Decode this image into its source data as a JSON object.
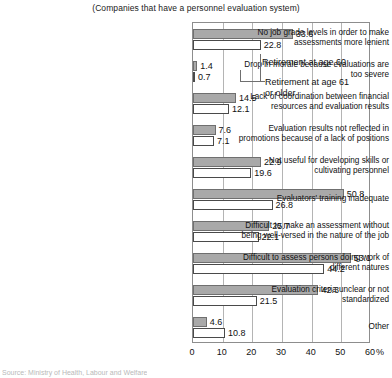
{
  "subtitle": "(Companies that have a personnel evaluation system)",
  "annotations": {
    "series_a_callout": "Retirement at age 60",
    "series_b_callout_line1": "Retirement at age 61",
    "series_b_callout_line2": "or older"
  },
  "axis": {
    "unit": "%",
    "ticks": [
      "0",
      "10",
      "20",
      "30",
      "40",
      "50",
      "60"
    ]
  },
  "footnote": "Source: Ministry of Health, Labour and Welfare",
  "colors": {
    "series_a_fill": "#a9a9a9",
    "series_b_fill": "#ffffff",
    "gridline": "#b4b4b4",
    "axis": "#8d8d8d"
  },
  "chart_data": {
    "type": "bar",
    "orientation": "horizontal",
    "title": "",
    "subtitle": "(Companies that have a personnel evaluation system)",
    "xlabel": "%",
    "ylabel": "",
    "xlim": [
      0,
      60
    ],
    "xticks": [
      0,
      10,
      20,
      30,
      40,
      50,
      60
    ],
    "grid": true,
    "legend_position": "inline-callout",
    "categories": [
      "No job grade levels in order to make assessments more lenient",
      "Drop in morale because evaluations are too severe",
      "Lack of coordination between financial resources and evaluation results",
      "Evaluation results not reflected in promotions because of a lack of positions",
      "Not useful for developing skills or cultivating personnel",
      "Evaluators' training inadequate",
      "Difficult to make an assessment without being well-versed in the nature of the job",
      "Difficult to assess persons doing work of different natures",
      "Evaluation criteria unclear or not standardized",
      "Other"
    ],
    "category_lines": [
      [
        "No job grade levels in order to make",
        "assessments more lenient"
      ],
      [
        "Drop in morale because evaluations are",
        "too severe"
      ],
      [
        "Lack of coordination between financial",
        "resources and evaluation results"
      ],
      [
        "Evaluation results not reflected in",
        "promotions because of a lack of positions"
      ],
      [
        "Not useful for developing skills or",
        "cultivating personnel"
      ],
      [
        "Evaluators' training inadequate"
      ],
      [
        "Difficult to make an assessment without",
        "being well-versed in the nature of the job"
      ],
      [
        "Difficult to assess persons doing work of",
        "different natures"
      ],
      [
        "Evaluation criteria unclear or not",
        "standardized"
      ],
      [
        "Other"
      ]
    ],
    "series": [
      {
        "name": "Retirement at age 60",
        "values": [
          33.6,
          1.4,
          14.5,
          7.6,
          22.9,
          50.8,
          25.7,
          53.1,
          42.3,
          4.6
        ]
      },
      {
        "name": "Retirement at age 61 or older",
        "values": [
          22.8,
          0.7,
          12.1,
          7.1,
          19.6,
          26.8,
          22.1,
          44.2,
          21.5,
          10.8
        ]
      }
    ]
  }
}
